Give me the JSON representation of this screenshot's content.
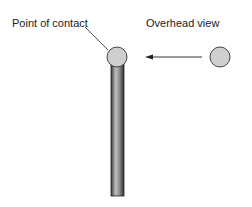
{
  "diagram": {
    "labels": {
      "point_of_contact": "Point of contact",
      "overhead_view": "Overhead view"
    },
    "elements": {
      "rod": {
        "description": "vertical rod",
        "color": "#8a8a8a"
      },
      "contact_ball": {
        "description": "ball on top of rod",
        "color": "#cfcfcf"
      },
      "incoming_ball": {
        "description": "ball approaching from right",
        "color": "#cfcfcf"
      },
      "arrow": {
        "direction": "left"
      }
    }
  }
}
